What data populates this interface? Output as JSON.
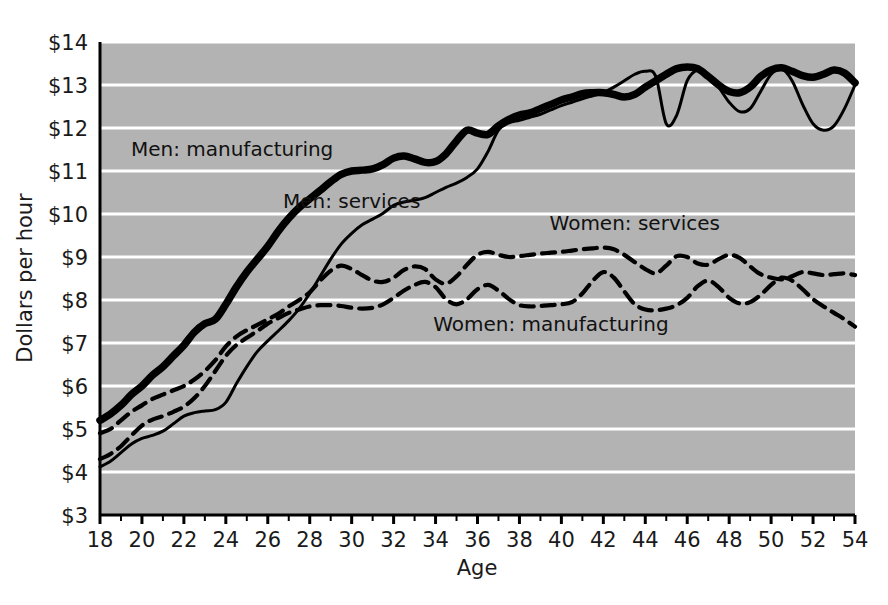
{
  "chart_data": {
    "type": "line",
    "title": "",
    "xlabel": "Age",
    "ylabel": "Dollars per hour",
    "xlim": [
      18,
      54
    ],
    "ylim": [
      3,
      14
    ],
    "x_tick_labels": [
      "18",
      "20",
      "22",
      "24",
      "26",
      "28",
      "30",
      "32",
      "34",
      "36",
      "38",
      "40",
      "42",
      "44",
      "46",
      "48",
      "50",
      "52",
      "54"
    ],
    "x_tick_step": 2,
    "x_minor_tick_step": 1,
    "y_tick_labels": [
      "$3",
      "$4",
      "$5",
      "$6",
      "$7",
      "$8",
      "$9",
      "$10",
      "$11",
      "$12",
      "$13",
      "$14"
    ],
    "y_tick_values": [
      3,
      4,
      5,
      6,
      7,
      8,
      9,
      10,
      11,
      12,
      13,
      14
    ],
    "grid": "horizontal-white-gridlines",
    "legend_position": "inline-annotations",
    "plot_background": "#b3b3b3",
    "gridline_color": "#ffffff",
    "line_color": "#000000",
    "x": [
      18,
      18.5,
      19,
      19.5,
      20,
      20.5,
      21,
      21.5,
      22,
      22.5,
      23,
      23.5,
      24,
      24.5,
      25,
      25.5,
      26,
      26.5,
      27,
      27.5,
      28,
      28.5,
      29,
      29.5,
      30,
      30.5,
      31,
      31.5,
      32,
      32.5,
      33,
      33.5,
      34,
      34.5,
      35,
      35.5,
      36,
      36.5,
      37,
      37.5,
      38,
      38.5,
      39,
      39.5,
      40,
      40.5,
      41,
      41.5,
      42,
      42.5,
      43,
      43.5,
      44,
      44.5,
      45,
      45.5,
      46,
      46.5,
      47,
      47.5,
      48,
      48.5,
      49,
      49.5,
      50,
      50.5,
      51,
      51.5,
      52,
      52.5,
      53,
      53.5,
      54
    ],
    "series": [
      {
        "name": "Men: manufacturing",
        "style": "solid-thick",
        "label_x": 24.3,
        "label_y": 11.35,
        "values": [
          5.2,
          5.35,
          5.55,
          5.8,
          6.0,
          6.25,
          6.45,
          6.7,
          6.95,
          7.25,
          7.45,
          7.55,
          7.9,
          8.3,
          8.65,
          8.95,
          9.25,
          9.6,
          9.9,
          10.15,
          10.35,
          10.55,
          10.75,
          10.92,
          11.0,
          11.02,
          11.05,
          11.15,
          11.3,
          11.35,
          11.28,
          11.2,
          11.22,
          11.4,
          11.7,
          11.95,
          11.88,
          11.85,
          12.05,
          12.2,
          12.3,
          12.35,
          12.45,
          12.55,
          12.65,
          12.72,
          12.8,
          12.82,
          12.82,
          12.78,
          12.72,
          12.78,
          12.95,
          13.1,
          13.25,
          13.38,
          13.42,
          13.38,
          13.2,
          13.0,
          12.85,
          12.82,
          12.95,
          13.2,
          13.35,
          13.4,
          13.32,
          13.22,
          13.18,
          13.25,
          13.35,
          13.28,
          13.05
        ]
      },
      {
        "name": "Men: services",
        "style": "solid-thin",
        "label_x": 30.0,
        "label_y": 10.15,
        "values": [
          4.12,
          4.25,
          4.45,
          4.65,
          4.78,
          4.85,
          4.95,
          5.12,
          5.3,
          5.38,
          5.42,
          5.45,
          5.62,
          6.05,
          6.45,
          6.8,
          7.05,
          7.28,
          7.52,
          7.8,
          8.15,
          8.55,
          8.95,
          9.3,
          9.55,
          9.75,
          9.88,
          10.02,
          10.2,
          10.28,
          10.32,
          10.38,
          10.5,
          10.62,
          10.72,
          10.85,
          11.05,
          11.45,
          11.95,
          12.12,
          12.18,
          12.25,
          12.32,
          12.42,
          12.52,
          12.6,
          12.68,
          12.75,
          12.82,
          12.95,
          13.1,
          13.25,
          13.32,
          13.2,
          12.1,
          12.3,
          13.1,
          13.35,
          13.25,
          12.95,
          12.6,
          12.38,
          12.45,
          12.85,
          13.25,
          13.38,
          13.1,
          12.55,
          12.1,
          11.95,
          12.05,
          12.45,
          13.0
        ]
      },
      {
        "name": "Women: services",
        "style": "dashed",
        "label_x": 43.5,
        "label_y": 9.62,
        "values": [
          4.9,
          5.0,
          5.2,
          5.4,
          5.55,
          5.7,
          5.8,
          5.9,
          6.0,
          6.15,
          6.35,
          6.6,
          6.92,
          7.15,
          7.3,
          7.42,
          7.55,
          7.68,
          7.85,
          8.0,
          8.18,
          8.45,
          8.68,
          8.8,
          8.72,
          8.58,
          8.45,
          8.42,
          8.52,
          8.7,
          8.78,
          8.72,
          8.48,
          8.38,
          8.55,
          8.82,
          9.05,
          9.12,
          9.05,
          9.0,
          9.02,
          9.05,
          9.08,
          9.1,
          9.12,
          9.15,
          9.18,
          9.2,
          9.22,
          9.18,
          9.05,
          8.88,
          8.72,
          8.62,
          8.8,
          9.02,
          9.0,
          8.85,
          8.82,
          8.95,
          9.05,
          8.98,
          8.78,
          8.6,
          8.52,
          8.48,
          8.55,
          8.65,
          8.62,
          8.58,
          8.6,
          8.62,
          8.58
        ]
      },
      {
        "name": "Women: manufacturing",
        "style": "dashed",
        "label_x": 39.5,
        "label_y": 7.28,
        "values": [
          4.3,
          4.42,
          4.6,
          4.85,
          5.08,
          5.22,
          5.3,
          5.4,
          5.52,
          5.72,
          6.0,
          6.35,
          6.7,
          6.95,
          7.12,
          7.28,
          7.45,
          7.58,
          7.7,
          7.78,
          7.85,
          7.88,
          7.88,
          7.86,
          7.82,
          7.8,
          7.82,
          7.9,
          8.05,
          8.22,
          8.35,
          8.42,
          8.3,
          8.02,
          7.9,
          8.02,
          8.25,
          8.35,
          8.22,
          8.02,
          7.88,
          7.85,
          7.86,
          7.88,
          7.9,
          7.95,
          8.15,
          8.45,
          8.65,
          8.52,
          8.2,
          7.9,
          7.78,
          7.76,
          7.8,
          7.88,
          8.05,
          8.32,
          8.45,
          8.3,
          8.05,
          7.92,
          7.95,
          8.12,
          8.35,
          8.52,
          8.45,
          8.25,
          8.02,
          7.85,
          7.7,
          7.55,
          7.38
        ]
      }
    ]
  },
  "axis": {
    "y_title": "Dollars per hour",
    "x_title": "Age"
  }
}
